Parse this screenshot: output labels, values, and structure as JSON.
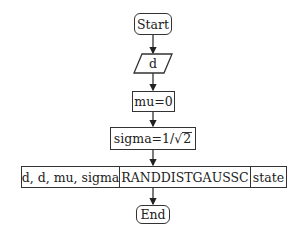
{
  "diagram": {
    "type": "flowchart",
    "nodes": {
      "start": {
        "label": "Start",
        "shape": "terminal"
      },
      "input": {
        "label": "d",
        "shape": "io"
      },
      "assign_mu": {
        "label": "mu=0",
        "shape": "process"
      },
      "assign_sigma": {
        "label_prefix": "sigma=1/",
        "label_sqrt_symbol": "√",
        "label_sqrt_arg": "2",
        "full_label": "sigma=1/√2",
        "shape": "process"
      },
      "call": {
        "shape": "subroutine",
        "args_in": "d, d, mu, sigma",
        "name": "RANDDISTGAUSSC",
        "args_out": "state"
      },
      "end": {
        "label": "End",
        "shape": "terminal"
      }
    },
    "edges": [
      {
        "from": "start",
        "to": "input"
      },
      {
        "from": "input",
        "to": "assign_mu"
      },
      {
        "from": "assign_mu",
        "to": "assign_sigma"
      },
      {
        "from": "assign_sigma",
        "to": "call"
      },
      {
        "from": "call",
        "to": "end"
      }
    ]
  }
}
